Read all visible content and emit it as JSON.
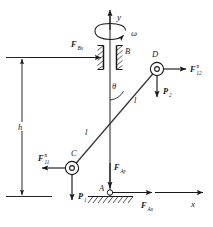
{
  "figure": {
    "type": "free-body-diagram",
    "background_color": "#ffffff",
    "line_color": "#1a1a1a",
    "shaft_color": "#8c8c8c"
  },
  "axes": {
    "y_label": "y",
    "x_label": "x",
    "origin_label": "A"
  },
  "rotation": {
    "omega_label": "ω"
  },
  "nodes": {
    "a": "A",
    "b": "B",
    "c": "C",
    "d": "D"
  },
  "angle": {
    "theta_label": "θ"
  },
  "lengths": {
    "rod_left_label": "l",
    "rod_right_label": "l",
    "height_label": "h"
  },
  "forces": [
    {
      "name": "F_Bx",
      "base": "F",
      "sub": "Bx",
      "sup": "",
      "direction": "right",
      "bold": true
    },
    {
      "name": "F_12_n",
      "base": "F",
      "sub": "12",
      "sup": "n",
      "direction": "right",
      "bold": true
    },
    {
      "name": "F_11_n",
      "base": "F",
      "sub": "11",
      "sup": "n",
      "direction": "left",
      "bold": true
    },
    {
      "name": "F_Ay",
      "base": "F",
      "sub": "Ay",
      "sup": "",
      "direction": "down",
      "bold": true
    },
    {
      "name": "F_Ax",
      "base": "F",
      "sub": "Ax",
      "sup": "",
      "direction": "right",
      "bold": true
    },
    {
      "name": "P_1",
      "base": "P",
      "sub": "1",
      "sup": "",
      "direction": "down",
      "bold": true
    },
    {
      "name": "P_2",
      "base": "P",
      "sub": "2",
      "sup": "",
      "direction": "down",
      "bold": true
    }
  ],
  "labels": {
    "f_bx_base": "F",
    "f_bx_sub": "Bx",
    "f12_base": "F",
    "f12_sub": "12",
    "f12_sup": "n",
    "f11_base": "F",
    "f11_sub": "11",
    "f11_sup": "n",
    "fay_base": "F",
    "fay_sub": "Ay",
    "fax_base": "F",
    "fax_sub": "Ax",
    "p1_base": "P",
    "p1_sub": "1",
    "p2_base": "P",
    "p2_sub": "2"
  }
}
